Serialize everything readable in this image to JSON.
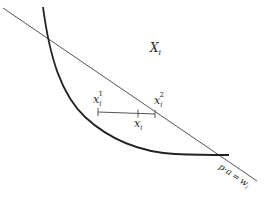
{
  "diagram": {
    "region_label": {
      "main": "X",
      "sub": "i"
    },
    "point_labels": {
      "x1": {
        "main": "x",
        "sub": "i",
        "sup": "1"
      },
      "x2": {
        "main": "x",
        "sub": "i",
        "sup": "2"
      },
      "xmid": {
        "main": "x",
        "sub": "i"
      }
    },
    "budget_line_label": {
      "p": "p",
      "dot": "·",
      "a": "a",
      "eq": "=",
      "w": "w",
      "w_sub": "i"
    },
    "colors": {
      "curve": "#222222",
      "line": "#555555",
      "segment": "#555555",
      "text": "#2a2a2a",
      "background": "#ffffff"
    }
  }
}
